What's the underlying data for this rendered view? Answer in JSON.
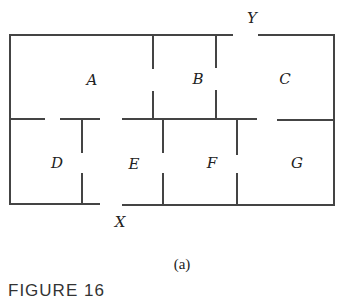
{
  "diagram": {
    "type": "floor-plan",
    "wall_color": "#444444",
    "rooms": [
      {
        "id": "A",
        "label": "A",
        "x": 92,
        "y": 80
      },
      {
        "id": "B",
        "label": "B",
        "x": 198,
        "y": 79
      },
      {
        "id": "C",
        "label": "C",
        "x": 285,
        "y": 79
      },
      {
        "id": "D",
        "label": "D",
        "x": 57,
        "y": 163
      },
      {
        "id": "E",
        "label": "E",
        "x": 134,
        "y": 164
      },
      {
        "id": "F",
        "label": "F",
        "x": 212,
        "y": 163
      },
      {
        "id": "G",
        "label": "G",
        "x": 297,
        "y": 163
      }
    ],
    "doors": [
      {
        "id": "Y",
        "label": "Y",
        "x": 252,
        "y": 18,
        "position": "top exterior"
      },
      {
        "id": "X",
        "label": "X",
        "x": 120,
        "y": 222,
        "position": "bottom exterior"
      }
    ],
    "subcaption": "(a)",
    "figure_caption": "FIGURE 16"
  }
}
